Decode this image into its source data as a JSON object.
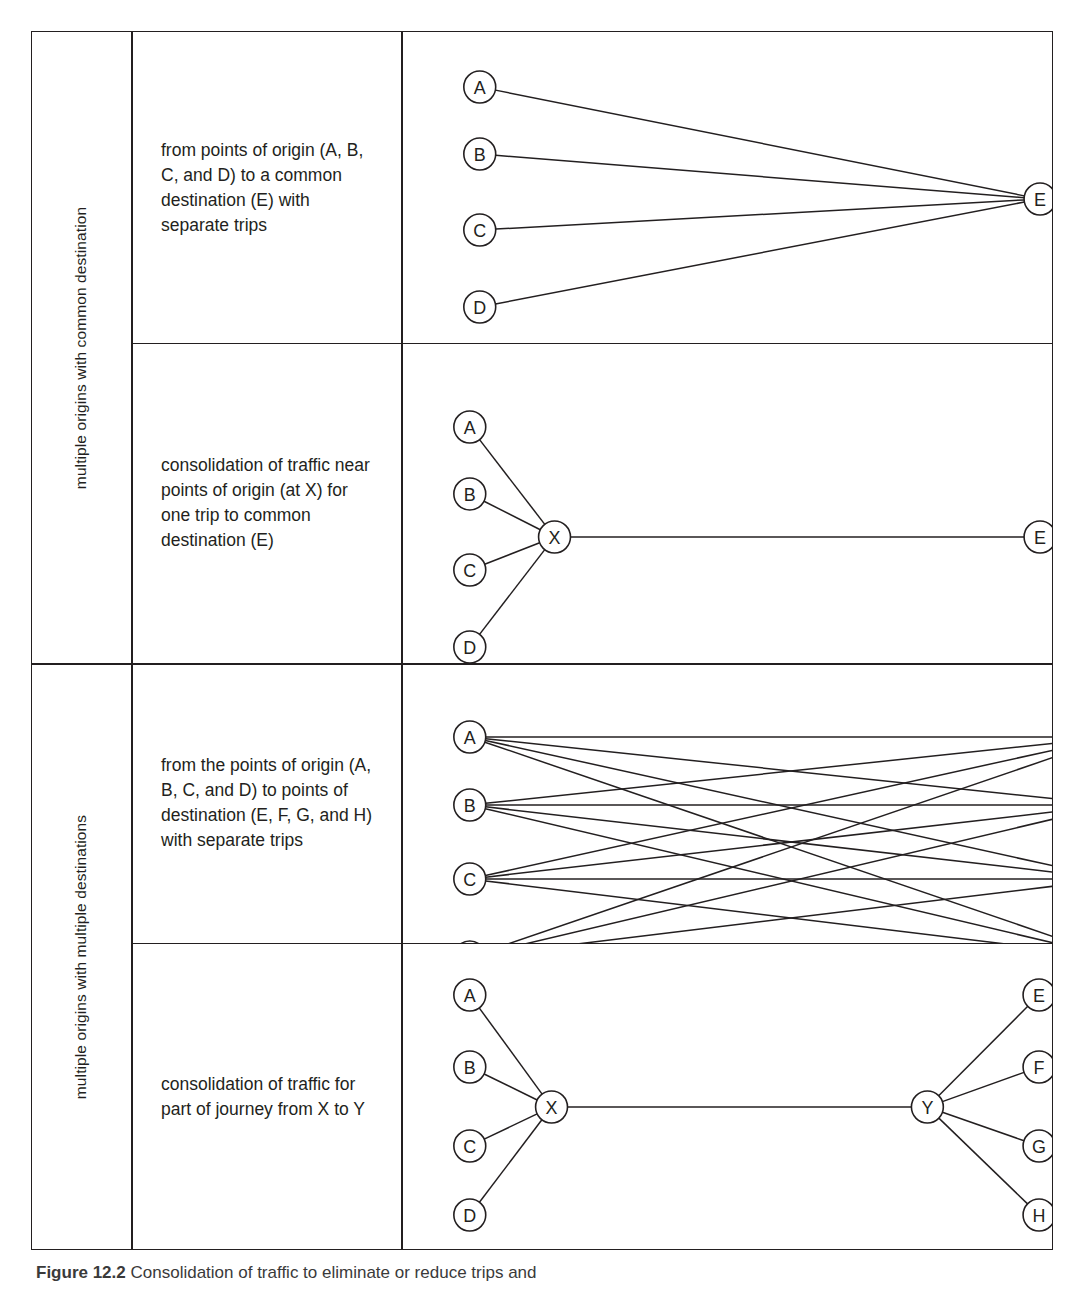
{
  "figure": {
    "caption_label": "Figure 12.2",
    "caption_text": "Consolidation of traffic to eliminate or reduce trips and"
  },
  "groups": [
    {
      "label": "multiple origins with common destination"
    },
    {
      "label": "multiple origins with multiple destinations"
    }
  ],
  "rows": [
    {
      "description": "from points of origin (A, B, C, and D) to a common destination (E) with separate trips",
      "diagram": {
        "type": "many-to-one",
        "nodes": [
          {
            "id": "A",
            "x": 79,
            "y": 55
          },
          {
            "id": "B",
            "x": 79,
            "y": 122
          },
          {
            "id": "C",
            "x": 79,
            "y": 198
          },
          {
            "id": "D",
            "x": 79,
            "y": 275
          },
          {
            "id": "E",
            "x": 641,
            "y": 167
          }
        ],
        "edges": [
          [
            "A",
            "E"
          ],
          [
            "B",
            "E"
          ],
          [
            "C",
            "E"
          ],
          [
            "D",
            "E"
          ]
        ]
      }
    },
    {
      "description": "consolidation of traffic near points of origin (at X) for one trip to common destination (E)",
      "diagram": {
        "type": "hub-to-one",
        "nodes": [
          {
            "id": "A",
            "x": 69,
            "y": 84
          },
          {
            "id": "B",
            "x": 69,
            "y": 151
          },
          {
            "id": "C",
            "x": 69,
            "y": 227
          },
          {
            "id": "D",
            "x": 69,
            "y": 304
          },
          {
            "id": "X",
            "x": 154,
            "y": 194
          },
          {
            "id": "E",
            "x": 641,
            "y": 194
          }
        ],
        "edges": [
          [
            "A",
            "X"
          ],
          [
            "B",
            "X"
          ],
          [
            "C",
            "X"
          ],
          [
            "D",
            "X"
          ],
          [
            "X",
            "E"
          ]
        ]
      }
    },
    {
      "description": "from the points of origin (A, B, C, and D) to points of destination (E, F, G, and H) with separate trips",
      "diagram": {
        "type": "many-to-many",
        "nodes": [
          {
            "id": "A",
            "x": 69,
            "y": 74
          },
          {
            "id": "B",
            "x": 69,
            "y": 142
          },
          {
            "id": "C",
            "x": 69,
            "y": 216
          },
          {
            "id": "D",
            "x": 69,
            "y": 294
          },
          {
            "id": "E",
            "x": 714,
            "y": 74
          },
          {
            "id": "F",
            "x": 714,
            "y": 142
          },
          {
            "id": "G",
            "x": 714,
            "y": 216
          },
          {
            "id": "H",
            "x": 714,
            "y": 294
          }
        ],
        "edges": [
          [
            "A",
            "E"
          ],
          [
            "A",
            "F"
          ],
          [
            "A",
            "G"
          ],
          [
            "A",
            "H"
          ],
          [
            "B",
            "E"
          ],
          [
            "B",
            "F"
          ],
          [
            "B",
            "G"
          ],
          [
            "B",
            "H"
          ],
          [
            "C",
            "E"
          ],
          [
            "C",
            "F"
          ],
          [
            "C",
            "G"
          ],
          [
            "C",
            "H"
          ],
          [
            "D",
            "E"
          ],
          [
            "D",
            "F"
          ],
          [
            "D",
            "G"
          ],
          [
            "D",
            "H"
          ]
        ]
      }
    },
    {
      "description": "consolidation of traffic for part of journey from X to Y",
      "diagram": {
        "type": "hub-to-hub",
        "nodes": [
          {
            "id": "A",
            "x": 69,
            "y": 52
          },
          {
            "id": "B",
            "x": 69,
            "y": 124
          },
          {
            "id": "C",
            "x": 69,
            "y": 203
          },
          {
            "id": "D",
            "x": 69,
            "y": 272
          },
          {
            "id": "X",
            "x": 151,
            "y": 164
          },
          {
            "id": "Y",
            "x": 528,
            "y": 164
          },
          {
            "id": "E",
            "x": 640,
            "y": 52
          },
          {
            "id": "F",
            "x": 640,
            "y": 124
          },
          {
            "id": "G",
            "x": 640,
            "y": 203
          },
          {
            "id": "H",
            "x": 640,
            "y": 272
          }
        ],
        "edges": [
          [
            "A",
            "X"
          ],
          [
            "B",
            "X"
          ],
          [
            "C",
            "X"
          ],
          [
            "D",
            "X"
          ],
          [
            "X",
            "Y"
          ],
          [
            "Y",
            "E"
          ],
          [
            "Y",
            "F"
          ],
          [
            "Y",
            "G"
          ],
          [
            "Y",
            "H"
          ]
        ]
      }
    }
  ],
  "style": {
    "line_color": "#231f20",
    "node_radius": 16,
    "background": "#ffffff"
  }
}
